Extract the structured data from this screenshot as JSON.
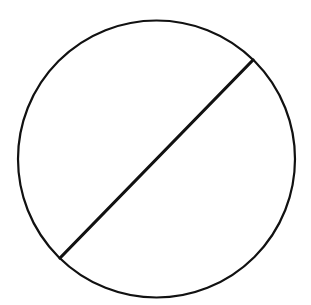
{
  "diagram": {
    "background": "#ffffff",
    "stroke_color": "#111111",
    "circle": {
      "cx": 156.5,
      "cy": 159,
      "r": 138.5,
      "stroke_width": 2.2
    },
    "chord": {
      "x1": 253,
      "y1": 60,
      "x2": 60,
      "y2": 258,
      "stroke_width": 3.2
    }
  }
}
